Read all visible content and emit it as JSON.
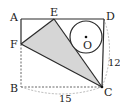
{
  "diagram": {
    "type": "geometry",
    "points": {
      "A": {
        "label": "A",
        "x": 21,
        "y": 19
      },
      "B": {
        "label": "B",
        "x": 21,
        "y": 87
      },
      "C": {
        "label": "C",
        "x": 102,
        "y": 87
      },
      "D": {
        "label": "D",
        "x": 104,
        "y": 19
      },
      "E": {
        "label": "E",
        "x": 54,
        "y": 19
      },
      "F": {
        "label": "F",
        "x": 21,
        "y": 44
      },
      "O": {
        "label": "O",
        "x": 86,
        "y": 37
      }
    },
    "circle": {
      "center": "O",
      "radius": 16
    },
    "measurements": {
      "CD": "12",
      "BC": "15"
    },
    "colors": {
      "shade": "#d4d4d4",
      "line": "#2a2a2a",
      "dashed": "#777777"
    }
  }
}
